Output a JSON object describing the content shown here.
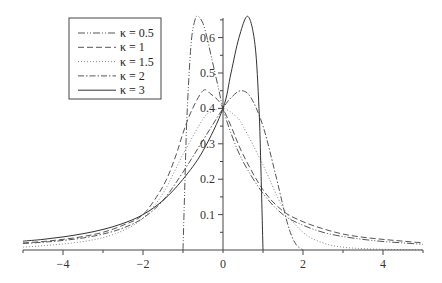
{
  "chart_data": {
    "type": "line",
    "title": "",
    "xlabel": "",
    "ylabel": "",
    "xlim": [
      -5,
      5
    ],
    "ylim": [
      0,
      0.66
    ],
    "grid": false,
    "legend_position": "upper-left",
    "x_ticks": [
      -4,
      -2,
      0,
      2,
      4
    ],
    "x_tick_labels": [
      "-4",
      "-2",
      "0",
      "2",
      "4"
    ],
    "y_ticks": [
      0.1,
      0.2,
      0.3,
      0.4,
      0.5,
      0.6
    ],
    "y_tick_labels": [
      "0.1",
      "0.2",
      "0.3",
      "0.4",
      "0.5",
      "0.6"
    ],
    "series": [
      {
        "name": "κ = 0.5",
        "style": "dash-dot-dot",
        "color": "#555555",
        "x": [
          -1.0,
          -0.95,
          -0.9,
          -0.8,
          -0.7,
          -0.62,
          -0.5,
          -0.4,
          -0.3,
          -0.2,
          -0.1,
          0,
          0.2,
          0.5,
          1.0,
          1.5,
          2.0,
          2.5,
          3,
          3.5,
          4,
          4.5,
          5
        ],
        "values": [
          0,
          0.2,
          0.38,
          0.58,
          0.65,
          0.66,
          0.64,
          0.6,
          0.55,
          0.5,
          0.45,
          0.4,
          0.33,
          0.25,
          0.16,
          0.1,
          0.07,
          0.05,
          0.038,
          0.03,
          0.024,
          0.02,
          0.016
        ]
      },
      {
        "name": "κ = 1",
        "style": "dashed",
        "color": "#555555",
        "x": [
          -5,
          -4.5,
          -4,
          -3.5,
          -3,
          -2.5,
          -2,
          -1.5,
          -1.2,
          -1.0,
          -0.8,
          -0.5,
          -0.3,
          -0.1,
          0,
          0.2,
          0.5,
          1.0,
          1.5,
          2.0,
          2.5,
          3,
          3.5,
          4,
          4.5,
          5
        ],
        "values": [
          0.02,
          0.024,
          0.03,
          0.038,
          0.05,
          0.07,
          0.1,
          0.18,
          0.26,
          0.33,
          0.39,
          0.45,
          0.44,
          0.42,
          0.4,
          0.35,
          0.27,
          0.17,
          0.11,
          0.08,
          0.06,
          0.045,
          0.036,
          0.03,
          0.025,
          0.02
        ]
      },
      {
        "name": "κ = 1.5",
        "style": "dotted",
        "color": "#888888",
        "x": [
          -5,
          -4.5,
          -4,
          -3.5,
          -3,
          -2.5,
          -2,
          -1.5,
          -1.0,
          -0.5,
          -0.3,
          0,
          0.3,
          0.5,
          1.0,
          1.5,
          2.0,
          2.5,
          3,
          3.5,
          4,
          4.5,
          5
        ],
        "values": [
          0.008,
          0.012,
          0.017,
          0.024,
          0.035,
          0.055,
          0.09,
          0.16,
          0.27,
          0.37,
          0.39,
          0.4,
          0.38,
          0.35,
          0.24,
          0.12,
          0.05,
          0.02,
          0.008,
          0.004,
          0.002,
          0.001,
          0.0005
        ]
      },
      {
        "name": "κ = 2",
        "style": "dash-dot",
        "color": "#555555",
        "x": [
          -5,
          -4.5,
          -4,
          -3.5,
          -3,
          -2.5,
          -2,
          -1.5,
          -1.0,
          -0.5,
          0,
          0.2,
          0.45,
          0.7,
          1.0,
          1.3,
          1.6,
          1.8,
          2.0
        ],
        "values": [
          0.018,
          0.022,
          0.027,
          0.034,
          0.045,
          0.062,
          0.09,
          0.14,
          0.22,
          0.31,
          0.4,
          0.43,
          0.45,
          0.43,
          0.35,
          0.22,
          0.08,
          0.02,
          0
        ]
      },
      {
        "name": "κ = 3",
        "style": "solid",
        "color": "#333333",
        "x": [
          -5,
          -4.5,
          -4,
          -3.5,
          -3,
          -2.5,
          -2,
          -1.5,
          -1.0,
          -0.5,
          0,
          0.2,
          0.4,
          0.62,
          0.8,
          0.9,
          0.95,
          1.0
        ],
        "values": [
          0.025,
          0.03,
          0.037,
          0.046,
          0.058,
          0.075,
          0.1,
          0.14,
          0.2,
          0.28,
          0.4,
          0.5,
          0.6,
          0.66,
          0.58,
          0.4,
          0.22,
          0
        ]
      }
    ]
  },
  "legend": {
    "items": [
      {
        "label": "κ = 0.5",
        "style": "dash-dot-dot"
      },
      {
        "label": "κ = 1",
        "style": "dashed"
      },
      {
        "label": "κ = 1.5",
        "style": "dotted"
      },
      {
        "label": "κ = 2",
        "style": "dash-dot"
      },
      {
        "label": "κ = 3",
        "style": "solid"
      }
    ]
  }
}
